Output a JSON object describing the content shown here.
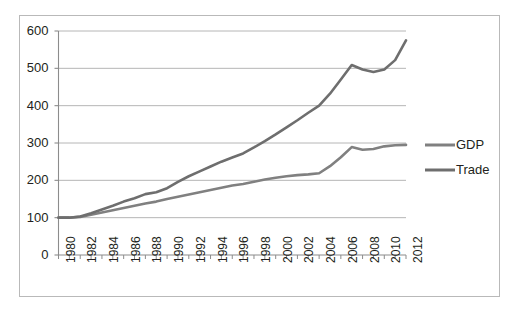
{
  "chart_data": {
    "type": "line",
    "title": "",
    "subtitle": "",
    "xlabel": "",
    "ylabel": "",
    "xlim": [
      1980,
      2012
    ],
    "ylim": [
      0,
      600
    ],
    "y_ticks": [
      0,
      100,
      200,
      300,
      400,
      500,
      600
    ],
    "y_tick_labels": [
      "0",
      "100",
      "200",
      "300",
      "400",
      "500",
      "600"
    ],
    "x_ticks": [
      1980,
      1981,
      1982,
      1983,
      1984,
      1985,
      1986,
      1987,
      1988,
      1989,
      1990,
      1991,
      1992,
      1993,
      1994,
      1995,
      1996,
      1997,
      1998,
      1999,
      2000,
      2001,
      2002,
      2003,
      2004,
      2005,
      2006,
      2007,
      2008,
      2009,
      2010,
      2011,
      2012
    ],
    "x_tick_labels": [
      "1980",
      "1982",
      "1984",
      "1986",
      "1988",
      "1990",
      "1992",
      "1994",
      "1996",
      "1998",
      "2000",
      "2002",
      "2004",
      "2006",
      "2008",
      "2010",
      "2012"
    ],
    "x_tick_label_step": 2,
    "x_tick_label_rotation": -90,
    "grid": "horizontal",
    "legend_position": "right",
    "x": [
      1980,
      1981,
      1982,
      1983,
      1984,
      1985,
      1986,
      1987,
      1988,
      1989,
      1990,
      1991,
      1992,
      1993,
      1994,
      1995,
      1996,
      1997,
      1998,
      1999,
      2000,
      2001,
      2002,
      2003,
      2004,
      2005,
      2006,
      2007,
      2008,
      2009,
      2010,
      2011,
      2012
    ],
    "series": [
      {
        "name": "GDP",
        "color": "#808080",
        "values": [
          100,
          100,
          102,
          108,
          114,
          120,
          126,
          132,
          138,
          143,
          150,
          156,
          162,
          168,
          174,
          180,
          186,
          190,
          196,
          202,
          207,
          211,
          214,
          216,
          219,
          238,
          262,
          289,
          282,
          284,
          291,
          294,
          295
        ]
      },
      {
        "name": "Trade",
        "color": "#6e6e6e",
        "values": [
          100,
          100,
          103,
          112,
          122,
          132,
          143,
          152,
          163,
          168,
          179,
          196,
          211,
          224,
          237,
          250,
          261,
          272,
          288,
          305,
          323,
          342,
          361,
          381,
          400,
          432,
          470,
          509,
          497,
          490,
          497,
          522,
          575
        ]
      }
    ]
  },
  "legend": {
    "items": [
      {
        "label": "GDP"
      },
      {
        "label": "Trade"
      }
    ]
  }
}
